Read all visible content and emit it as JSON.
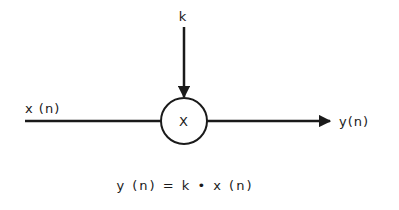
{
  "diagram": {
    "type": "signal-flow multiplier",
    "input_label": "x (n)",
    "gain_label": "k",
    "operator_symbol": "X",
    "output_label": "y(n)",
    "equation": "y (n) = k • x (n)",
    "colors": {
      "stroke": "#1a1a1a",
      "background": "#ffffff"
    }
  }
}
